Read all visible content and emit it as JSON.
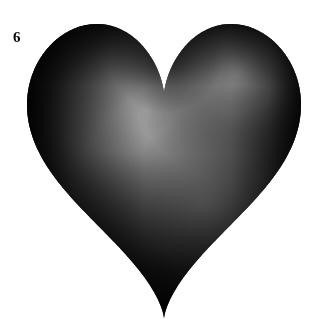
{
  "figure": {
    "label": "6",
    "caption_number": "6",
    "background_color": "#ffffff"
  },
  "canvas": {
    "width": 318,
    "height": 325
  },
  "object": {
    "name": "heart-surface",
    "type": "3d-parametric-surface",
    "render_style": "shaded-wireframe",
    "silhouette": "heart",
    "bounding_box": {
      "left": 27,
      "top": 24,
      "right": 301,
      "bottom": 319
    },
    "apex_bottom": {
      "x": 165,
      "y": 318
    },
    "cleft_top": {
      "x": 166,
      "y": 49
    },
    "lobe_left_peak": {
      "x": 95,
      "y": 26
    },
    "lobe_right_peak": {
      "x": 233,
      "y": 25
    }
  },
  "shading": {
    "type": "diffuse-specular-grayscale",
    "highlight_center": {
      "x": 150,
      "y": 120
    },
    "highlight_color": "#bcbcbc",
    "midtone_color": "#6e6e6e",
    "shadow_color": "#0a0a0a",
    "secondary_highlight": {
      "x": 238,
      "y": 72
    },
    "secondary_highlight_color": "#8a8a8a"
  },
  "mesh": {
    "visible": true,
    "line_color": "#181818",
    "line_width": 0.8,
    "u_divisions": 26,
    "v_divisions": 16,
    "cell_size_px": 23,
    "inner_contour_visible": true,
    "inner_contour_description": "inner heart-shaped ridge silhouette"
  },
  "chart_data": {
    "type": "scatter",
    "title": "",
    "xlabel": "",
    "ylabel": "",
    "annotations": [
      "6"
    ],
    "categories": [],
    "values": []
  }
}
